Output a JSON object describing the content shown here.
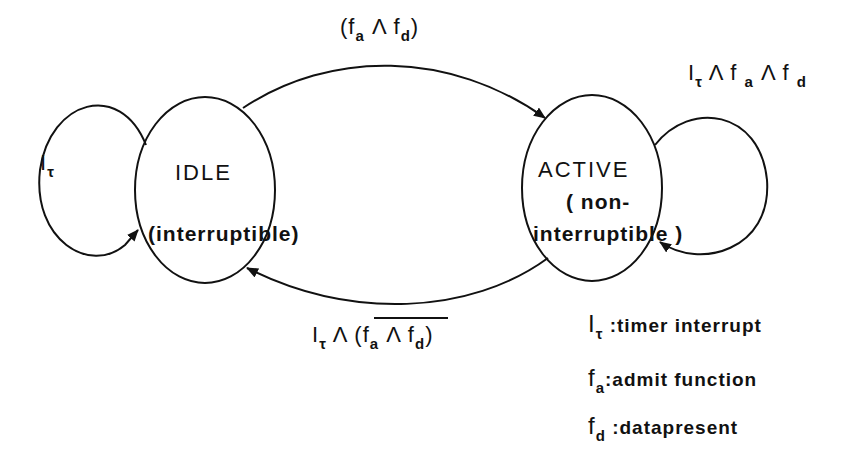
{
  "diagram": {
    "type": "state-machine",
    "states": [
      {
        "id": "idle",
        "name": "IDLE",
        "subtitle": "(interruptible)"
      },
      {
        "id": "active",
        "name": "ACTIVE",
        "subtitle_line1": "( non-",
        "subtitle_line2": "interruptible )"
      }
    ],
    "transitions": {
      "idle_self": {
        "sym": "I",
        "sub": "τ"
      },
      "idle_to_active": {
        "open": "(f",
        "sub_a": "a",
        "and": " Λ f",
        "sub_d": "d",
        "close": ")"
      },
      "active_self": {
        "sym": "I",
        "sub_tau": "τ",
        "p1": " Λ f ",
        "sub_a": "a",
        "p2": " Λ f ",
        "sub_d": "d"
      },
      "active_to_idle": {
        "sym": "I",
        "sub_tau": "τ",
        "and": " Λ ",
        "open": "(f",
        "sub_a": "a",
        "and2": " Λ f",
        "sub_d": "d",
        "close": ")"
      }
    },
    "legend": [
      {
        "sym": "I",
        "sub": "τ",
        "desc": ":timer interrupt"
      },
      {
        "sym": "f",
        "sub": "a",
        "desc": ":admit function"
      },
      {
        "sym": "f",
        "sub": "d",
        "desc": ":datapresent"
      }
    ]
  }
}
